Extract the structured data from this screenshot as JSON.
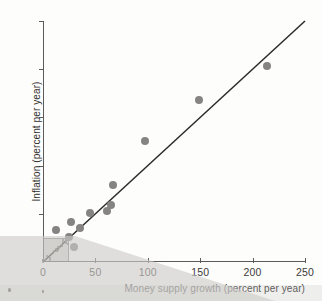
{
  "chart_data": {
    "type": "scatter",
    "title": "",
    "xlabel": "Money supply growth (percent per year)",
    "ylabel": "Inflation (percent per year)",
    "xlim": [
      0,
      250
    ],
    "ylim": [
      0,
      250
    ],
    "xticks": [
      0,
      50,
      100,
      150,
      200,
      250
    ],
    "yticks": [
      0,
      50,
      100,
      150,
      200,
      250
    ],
    "xtick_labels": [
      "0",
      "50",
      "100",
      "150",
      "200",
      "250"
    ],
    "ytick_labels": [
      "0",
      "50",
      "100",
      "150",
      "200",
      "250"
    ],
    "grid": false,
    "legend": false,
    "points": [
      {
        "x": 12,
        "y": 33
      },
      {
        "x": 25,
        "y": 26
      },
      {
        "x": 27,
        "y": 41
      },
      {
        "x": 30,
        "y": 16
      },
      {
        "x": 35,
        "y": 35
      },
      {
        "x": 45,
        "y": 51
      },
      {
        "x": 61,
        "y": 53
      },
      {
        "x": 65,
        "y": 59
      },
      {
        "x": 67,
        "y": 80
      },
      {
        "x": 97,
        "y": 126
      },
      {
        "x": 149,
        "y": 168
      },
      {
        "x": 214,
        "y": 203
      }
    ],
    "reference_line": {
      "label": "45-degree line",
      "from": [
        0,
        0
      ],
      "to": [
        250,
        250
      ],
      "slope": 1,
      "intercept": 0
    },
    "inset_box": {
      "label": "detail region",
      "x_range": [
        0,
        25
      ],
      "y_range": [
        0,
        25
      ]
    },
    "micro_cluster": {
      "label": "low-inflation country cluster",
      "count": 28,
      "x_range": [
        0,
        25
      ],
      "y_range": [
        0,
        25
      ]
    },
    "colors": {
      "marker": "#868482",
      "line": "#2b2a28",
      "axis": "#5d5b59",
      "inset_fill": "#bcbab7",
      "background": "#fdfdfc"
    }
  }
}
